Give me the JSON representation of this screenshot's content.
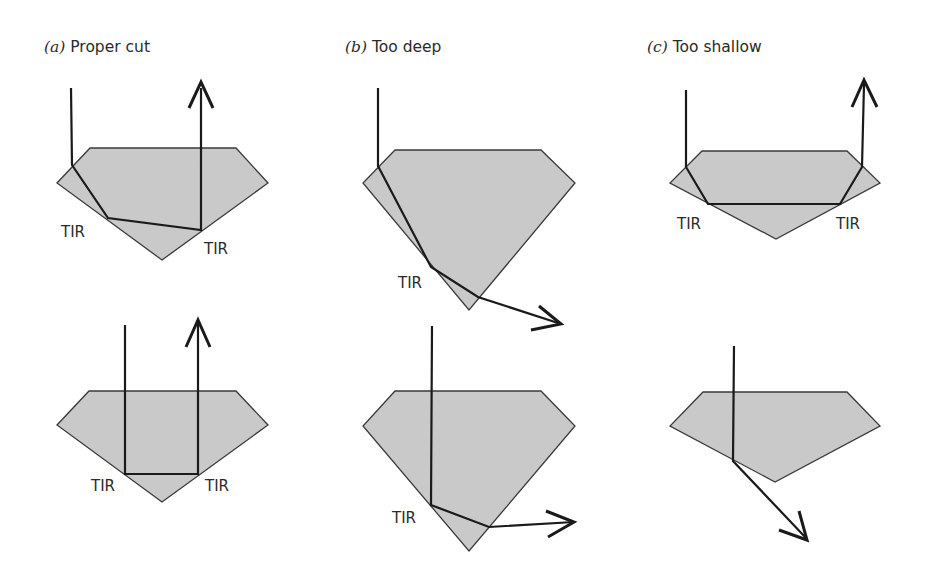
{
  "figure": {
    "panels": [
      {
        "letter": "(a)",
        "title": "Proper cut"
      },
      {
        "letter": "(b)",
        "title": "Too deep"
      },
      {
        "letter": "(c)",
        "title": "Too shallow"
      }
    ],
    "label_tir": "TIR",
    "colors": {
      "gem_fill": "#c9c9c9",
      "gem_stroke": "#3a3a3a",
      "ray": "#1a1a1a"
    },
    "diagrams": [
      {
        "id": "a-top",
        "gem": "90,148 236,148 268,183 162,260 57,183",
        "ray": "71,88 72,165 108,218 201,230 201,88",
        "tir_labels": [
          {
            "x": 61,
            "y": 237
          },
          {
            "x": 204,
            "y": 254
          }
        ]
      },
      {
        "id": "b-top",
        "gem": "395,150 541,150 575,183 469,310 363,183",
        "ray": "378,88 378,166 431,267 478,297 556,322",
        "tir_labels": [
          {
            "x": 398,
            "y": 288
          }
        ]
      },
      {
        "id": "c-top",
        "gem": "702,151 847,151 880,183 776,239 670,183",
        "ray": "686,90 686,167 708,204 840,204 862,167 864,84",
        "tir_labels": [
          {
            "x": 677,
            "y": 229
          },
          {
            "x": 836,
            "y": 229
          }
        ]
      },
      {
        "id": "a-bottom",
        "gem": "89,391 236,391 268,425 162,502 57,425",
        "ray": "125,325 125,474 198,474 198,322",
        "tir_labels": [
          {
            "x": 91,
            "y": 491
          },
          {
            "x": 205,
            "y": 491
          }
        ]
      },
      {
        "id": "b-bottom",
        "gem": "395,391 541,391 575,426 469,551 363,426",
        "ray": "432,326 431,505 489,527 572,522",
        "tir_labels": [
          {
            "x": 392,
            "y": 523
          }
        ]
      },
      {
        "id": "c-bottom",
        "gem": "703,392 847,392 880,426 775,482 670,426",
        "ray": "734,346 733,461 806,538",
        "tir_labels": []
      }
    ]
  }
}
